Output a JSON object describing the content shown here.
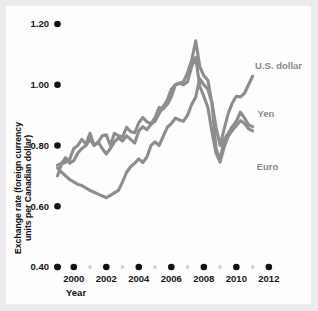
{
  "chart_data": {
    "type": "line",
    "title": "",
    "xlabel": "Year",
    "ylabel": "Exchange rate (foreign currency units per Canadian dollar)",
    "ylabel_line1": "Exchange rate (foreign currency",
    "ylabel_line2": "units per Canadian dollar)",
    "xlim": [
      1999.0,
      2012.5
    ],
    "ylim": [
      0.4,
      1.2
    ],
    "grid": false,
    "legend_position": "inline-right",
    "line_color": "#8d8d8d",
    "tick_color": "#121212",
    "minor_tick_color": "#d2d2d2",
    "ytick_labels": [
      "1.20",
      "1.00",
      "0.80",
      "0.60",
      "0.40"
    ],
    "ytick_values": [
      1.2,
      1.0,
      0.8,
      0.6,
      0.4
    ],
    "xtick_labels": [
      "2000",
      "2002",
      "2004",
      "2006",
      "2008",
      "2010",
      "2012"
    ],
    "xtick_values": [
      2000,
      2002,
      2004,
      2006,
      2008,
      2010,
      2012
    ],
    "xminor_values": [
      2001,
      2003,
      2005,
      2007,
      2009,
      2011
    ],
    "x_origin_marker": 1999.0,
    "series": [
      {
        "name": "U.S. dollar",
        "label_x": 2011.15,
        "label_y": 1.053,
        "x": [
          1999.0,
          1999.25,
          1999.5,
          1999.75,
          2000.0,
          2000.25,
          2000.5,
          2000.75,
          2001.0,
          2001.25,
          2001.5,
          2001.75,
          2002.0,
          2002.25,
          2002.5,
          2002.75,
          2003.0,
          2003.25,
          2003.5,
          2003.75,
          2004.0,
          2004.25,
          2004.5,
          2004.75,
          2005.0,
          2005.25,
          2005.5,
          2005.75,
          2006.0,
          2006.25,
          2006.5,
          2006.75,
          2007.0,
          2007.25,
          2007.5,
          2007.75,
          2008.0,
          2008.25,
          2008.5,
          2008.75,
          2009.0,
          2009.25,
          2009.5,
          2009.75,
          2010.0,
          2010.25,
          2010.5,
          2010.75,
          2011.0
        ],
        "values": [
          0.726,
          0.712,
          0.7,
          0.688,
          0.68,
          0.672,
          0.668,
          0.66,
          0.652,
          0.646,
          0.64,
          0.634,
          0.628,
          0.636,
          0.644,
          0.652,
          0.68,
          0.712,
          0.73,
          0.742,
          0.756,
          0.744,
          0.762,
          0.8,
          0.812,
          0.8,
          0.83,
          0.86,
          0.872,
          0.89,
          0.884,
          0.88,
          0.9,
          0.935,
          0.96,
          1.02,
          1.0,
          0.985,
          0.94,
          0.86,
          0.8,
          0.855,
          0.905,
          0.94,
          0.962,
          0.96,
          0.972,
          1.0,
          1.028
        ]
      },
      {
        "name": "Yen",
        "label_x": 2011.3,
        "label_y": 0.893,
        "x": [
          1999.0,
          1999.25,
          1999.5,
          1999.75,
          2000.0,
          2000.25,
          2000.5,
          2000.75,
          2001.0,
          2001.25,
          2001.5,
          2001.75,
          2002.0,
          2002.25,
          2002.5,
          2002.75,
          2003.0,
          2003.25,
          2003.5,
          2003.75,
          2004.0,
          2004.25,
          2004.5,
          2004.75,
          2005.0,
          2005.25,
          2005.5,
          2005.75,
          2006.0,
          2006.25,
          2006.5,
          2006.75,
          2007.0,
          2007.25,
          2007.5,
          2007.75,
          2008.0,
          2008.25,
          2008.5,
          2008.75,
          2009.0,
          2009.25,
          2009.5,
          2009.75,
          2010.0,
          2010.25,
          2010.5,
          2010.75,
          2011.0
        ],
        "values": [
          0.735,
          0.742,
          0.76,
          0.742,
          0.75,
          0.775,
          0.79,
          0.8,
          0.82,
          0.8,
          0.812,
          0.79,
          0.772,
          0.79,
          0.812,
          0.825,
          0.815,
          0.832,
          0.82,
          0.808,
          0.848,
          0.862,
          0.852,
          0.87,
          0.88,
          0.905,
          0.928,
          0.95,
          0.985,
          1.0,
          1.005,
          1.01,
          1.04,
          1.08,
          1.145,
          1.06,
          1.03,
          1.015,
          0.94,
          0.79,
          0.752,
          0.82,
          0.84,
          0.862,
          0.88,
          0.91,
          0.89,
          0.868,
          0.862
        ]
      },
      {
        "name": "Euro",
        "label_x": 2011.25,
        "label_y": 0.718,
        "x": [
          1999.0,
          1999.25,
          1999.5,
          1999.75,
          2000.0,
          2000.25,
          2000.5,
          2000.75,
          2001.0,
          2001.25,
          2001.5,
          2001.75,
          2002.0,
          2002.25,
          2002.5,
          2002.75,
          2003.0,
          2003.25,
          2003.5,
          2003.75,
          2004.0,
          2004.25,
          2004.5,
          2004.75,
          2005.0,
          2005.25,
          2005.5,
          2005.75,
          2006.0,
          2006.25,
          2006.5,
          2006.75,
          2007.0,
          2007.25,
          2007.5,
          2007.75,
          2008.0,
          2008.25,
          2008.5,
          2008.75,
          2009.0,
          2009.25,
          2009.5,
          2009.75,
          2010.0,
          2010.25,
          2010.5,
          2010.75,
          2011.0
        ],
        "values": [
          0.7,
          0.74,
          0.745,
          0.755,
          0.79,
          0.8,
          0.82,
          0.805,
          0.84,
          0.8,
          0.81,
          0.832,
          0.835,
          0.8,
          0.84,
          0.832,
          0.828,
          0.86,
          0.845,
          0.842,
          0.875,
          0.892,
          0.878,
          0.872,
          0.892,
          0.925,
          0.92,
          0.935,
          0.96,
          1.0,
          1.005,
          1.0,
          1.01,
          1.06,
          1.09,
          0.995,
          0.962,
          0.925,
          0.845,
          0.775,
          0.745,
          0.795,
          0.83,
          0.85,
          0.865,
          0.882,
          0.872,
          0.855,
          0.848
        ]
      }
    ]
  }
}
